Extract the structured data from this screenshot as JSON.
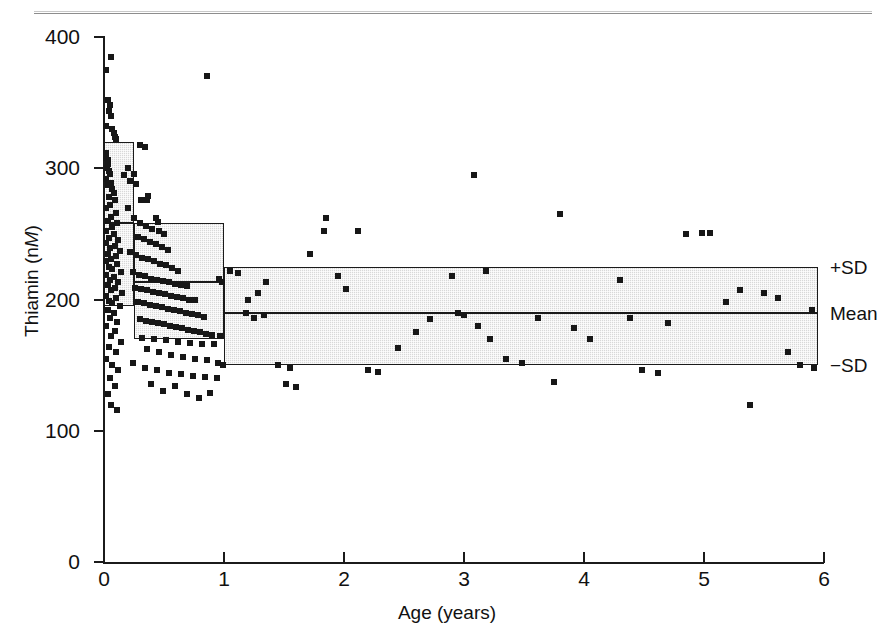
{
  "figure": {
    "kind": "scatter-plot-with-sd-bands"
  },
  "axes": {
    "y_title_prefix": "Thiamin (n",
    "y_title_italic": "M",
    "y_title_suffix": ")",
    "x_title": "Age (years)",
    "y_ticks": [
      "0",
      "100",
      "200",
      "300",
      "400"
    ],
    "x_ticks": [
      "0",
      "1",
      "2",
      "3",
      "4",
      "5",
      "6"
    ]
  },
  "legend": {
    "plus_sd": "+SD",
    "mean": "Mean",
    "minus_sd": "−SD"
  },
  "chart_data": {
    "type": "scatter",
    "title": "",
    "xlabel": "Age (years)",
    "ylabel": "Thiamin (nM)",
    "xlim": [
      0,
      6
    ],
    "ylim": [
      0,
      400
    ],
    "xticks": [
      0,
      1,
      2,
      3,
      4,
      5,
      6
    ],
    "yticks": [
      0,
      100,
      200,
      300,
      400
    ],
    "grid": false,
    "legend_position": "right-outside",
    "marker": {
      "shape": "square",
      "color": "#171717",
      "size_px": 6
    },
    "reference_bands": [
      {
        "label": "0–0.25 y",
        "x_start": 0.0,
        "x_end": 0.25,
        "plus_sd": 320,
        "mean": 258,
        "minus_sd": 195
      },
      {
        "label": "0.25–1 y",
        "x_start": 0.25,
        "x_end": 1.0,
        "plus_sd": 258,
        "mean": 213,
        "minus_sd": 170
      },
      {
        "label": "1–5.95 y",
        "x_start": 1.0,
        "x_end": 5.95,
        "plus_sd": 225,
        "mean": 190,
        "minus_sd": 150
      }
    ],
    "band_style": {
      "fill": "#d8d8d8",
      "stipple": true,
      "border": "#1b1b1b"
    },
    "points": [
      [
        0.02,
        375
      ],
      [
        0.06,
        385
      ],
      [
        0.03,
        352
      ],
      [
        0.05,
        348
      ],
      [
        0.06,
        340
      ],
      [
        0.04,
        344
      ],
      [
        0.02,
        332
      ],
      [
        0.07,
        330
      ],
      [
        0.08,
        327
      ],
      [
        0.09,
        324
      ],
      [
        0.1,
        322
      ],
      [
        0.015,
        312
      ],
      [
        0.02,
        308
      ],
      [
        0.03,
        306
      ],
      [
        0.035,
        303
      ],
      [
        0.025,
        300
      ],
      [
        0.04,
        298
      ],
      [
        0.05,
        296
      ],
      [
        0.02,
        292
      ],
      [
        0.06,
        289
      ],
      [
        0.03,
        287
      ],
      [
        0.07,
        284
      ],
      [
        0.08,
        281
      ],
      [
        0.04,
        278
      ],
      [
        0.09,
        276
      ],
      [
        0.05,
        272
      ],
      [
        0.02,
        270
      ],
      [
        0.1,
        266
      ],
      [
        0.06,
        263
      ],
      [
        0.03,
        260
      ],
      [
        0.11,
        258
      ],
      [
        0.07,
        255
      ],
      [
        0.015,
        252
      ],
      [
        0.08,
        250
      ],
      [
        0.04,
        247
      ],
      [
        0.12,
        245
      ],
      [
        0.02,
        243
      ],
      [
        0.09,
        241
      ],
      [
        0.05,
        239
      ],
      [
        0.13,
        237
      ],
      [
        0.03,
        235
      ],
      [
        0.1,
        233
      ],
      [
        0.06,
        231
      ],
      [
        0.02,
        229
      ],
      [
        0.11,
        227
      ],
      [
        0.04,
        225
      ],
      [
        0.07,
        223
      ],
      [
        0.14,
        221
      ],
      [
        0.02,
        219
      ],
      [
        0.08,
        217
      ],
      [
        0.05,
        215
      ],
      [
        0.12,
        213
      ],
      [
        0.03,
        211
      ],
      [
        0.09,
        209
      ],
      [
        0.06,
        207
      ],
      [
        0.15,
        205
      ],
      [
        0.02,
        203
      ],
      [
        0.1,
        201
      ],
      [
        0.04,
        199
      ],
      [
        0.07,
        197
      ],
      [
        0.13,
        195
      ],
      [
        0.03,
        192
      ],
      [
        0.08,
        190
      ],
      [
        0.05,
        186
      ],
      [
        0.11,
        183
      ],
      [
        0.02,
        180
      ],
      [
        0.09,
        176
      ],
      [
        0.06,
        172
      ],
      [
        0.14,
        168
      ],
      [
        0.04,
        164
      ],
      [
        0.1,
        160
      ],
      [
        0.02,
        155
      ],
      [
        0.07,
        150
      ],
      [
        0.12,
        146
      ],
      [
        0.05,
        140
      ],
      [
        0.09,
        134
      ],
      [
        0.03,
        128
      ],
      [
        0.06,
        120
      ],
      [
        0.11,
        116
      ],
      [
        0.3,
        318
      ],
      [
        0.34,
        316
      ],
      [
        0.2,
        300
      ],
      [
        0.25,
        296
      ],
      [
        0.22,
        290
      ],
      [
        0.27,
        288
      ],
      [
        0.17,
        295
      ],
      [
        0.31,
        276
      ],
      [
        0.37,
        279
      ],
      [
        0.36,
        276
      ],
      [
        0.43,
        262
      ],
      [
        0.45,
        259
      ],
      [
        0.2,
        270
      ],
      [
        0.25,
        262
      ],
      [
        0.3,
        258
      ],
      [
        0.35,
        256
      ],
      [
        0.4,
        254
      ],
      [
        0.46,
        252
      ],
      [
        0.5,
        250
      ],
      [
        0.28,
        248
      ],
      [
        0.33,
        246
      ],
      [
        0.38,
        244
      ],
      [
        0.43,
        242
      ],
      [
        0.48,
        240
      ],
      [
        0.53,
        238
      ],
      [
        0.22,
        236
      ],
      [
        0.27,
        234
      ],
      [
        0.32,
        232
      ],
      [
        0.37,
        231
      ],
      [
        0.42,
        229
      ],
      [
        0.47,
        227
      ],
      [
        0.52,
        226
      ],
      [
        0.57,
        224
      ],
      [
        0.62,
        222
      ],
      [
        0.24,
        221
      ],
      [
        0.29,
        219
      ],
      [
        0.34,
        218
      ],
      [
        0.39,
        216
      ],
      [
        0.44,
        215
      ],
      [
        0.49,
        214
      ],
      [
        0.54,
        213
      ],
      [
        0.59,
        212
      ],
      [
        0.64,
        211
      ],
      [
        0.69,
        210
      ],
      [
        0.26,
        209
      ],
      [
        0.31,
        208
      ],
      [
        0.36,
        207
      ],
      [
        0.41,
        206
      ],
      [
        0.46,
        205
      ],
      [
        0.51,
        204
      ],
      [
        0.56,
        203
      ],
      [
        0.61,
        202
      ],
      [
        0.66,
        201
      ],
      [
        0.71,
        200
      ],
      [
        0.76,
        200
      ],
      [
        0.28,
        198
      ],
      [
        0.33,
        197
      ],
      [
        0.38,
        196
      ],
      [
        0.43,
        195
      ],
      [
        0.48,
        194
      ],
      [
        0.53,
        193
      ],
      [
        0.58,
        192
      ],
      [
        0.63,
        191
      ],
      [
        0.68,
        190
      ],
      [
        0.73,
        189
      ],
      [
        0.78,
        188
      ],
      [
        0.83,
        187
      ],
      [
        0.3,
        185
      ],
      [
        0.35,
        184
      ],
      [
        0.4,
        183
      ],
      [
        0.45,
        182
      ],
      [
        0.5,
        181
      ],
      [
        0.55,
        180
      ],
      [
        0.6,
        179
      ],
      [
        0.65,
        178
      ],
      [
        0.7,
        177
      ],
      [
        0.75,
        176
      ],
      [
        0.8,
        175
      ],
      [
        0.85,
        174
      ],
      [
        0.9,
        173
      ],
      [
        0.32,
        171
      ],
      [
        0.42,
        170
      ],
      [
        0.52,
        169
      ],
      [
        0.62,
        168
      ],
      [
        0.72,
        167
      ],
      [
        0.82,
        166
      ],
      [
        0.92,
        166
      ],
      [
        0.36,
        162
      ],
      [
        0.46,
        160
      ],
      [
        0.56,
        158
      ],
      [
        0.66,
        156
      ],
      [
        0.76,
        155
      ],
      [
        0.86,
        154
      ],
      [
        0.95,
        152
      ],
      [
        0.24,
        152
      ],
      [
        0.34,
        148
      ],
      [
        0.44,
        146
      ],
      [
        0.54,
        144
      ],
      [
        0.64,
        143
      ],
      [
        0.74,
        142
      ],
      [
        0.84,
        141
      ],
      [
        0.94,
        140
      ],
      [
        0.39,
        136
      ],
      [
        0.59,
        134
      ],
      [
        0.49,
        130
      ],
      [
        0.69,
        128
      ],
      [
        0.88,
        129
      ],
      [
        0.79,
        125
      ],
      [
        0.96,
        216
      ],
      [
        0.98,
        213
      ],
      [
        0.97,
        172
      ],
      [
        0.99,
        150
      ],
      [
        0.86,
        370
      ],
      [
        1.05,
        222
      ],
      [
        1.12,
        220
      ],
      [
        1.2,
        200
      ],
      [
        1.28,
        205
      ],
      [
        1.35,
        213
      ],
      [
        1.18,
        190
      ],
      [
        1.25,
        186
      ],
      [
        1.33,
        188
      ],
      [
        1.45,
        150
      ],
      [
        1.55,
        148
      ],
      [
        1.52,
        136
      ],
      [
        1.6,
        133
      ],
      [
        1.72,
        235
      ],
      [
        1.83,
        252
      ],
      [
        1.85,
        262
      ],
      [
        1.95,
        218
      ],
      [
        2.02,
        208
      ],
      [
        2.12,
        252
      ],
      [
        2.2,
        146
      ],
      [
        2.28,
        145
      ],
      [
        2.45,
        163
      ],
      [
        2.6,
        175
      ],
      [
        2.72,
        185
      ],
      [
        2.9,
        218
      ],
      [
        2.95,
        190
      ],
      [
        3.0,
        188
      ],
      [
        3.08,
        295
      ],
      [
        3.18,
        222
      ],
      [
        3.12,
        180
      ],
      [
        3.22,
        170
      ],
      [
        3.35,
        155
      ],
      [
        3.48,
        152
      ],
      [
        3.62,
        186
      ],
      [
        3.75,
        137
      ],
      [
        3.8,
        265
      ],
      [
        3.92,
        178
      ],
      [
        4.05,
        170
      ],
      [
        4.3,
        215
      ],
      [
        4.38,
        186
      ],
      [
        4.48,
        146
      ],
      [
        4.62,
        144
      ],
      [
        4.7,
        182
      ],
      [
        4.85,
        250
      ],
      [
        4.98,
        251
      ],
      [
        5.05,
        251
      ],
      [
        5.18,
        198
      ],
      [
        5.3,
        207
      ],
      [
        5.38,
        120
      ],
      [
        5.5,
        205
      ],
      [
        5.62,
        201
      ],
      [
        5.7,
        160
      ],
      [
        5.8,
        150
      ],
      [
        5.9,
        192
      ],
      [
        5.92,
        148
      ]
    ]
  }
}
